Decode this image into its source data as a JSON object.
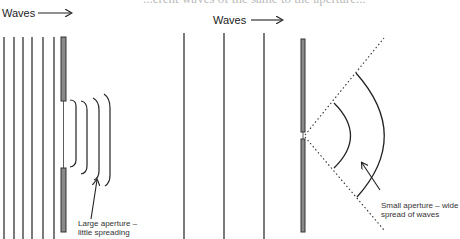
{
  "page": {
    "clipped_header": "...erent waves of the same to the aperture..."
  },
  "left_panel": {
    "waves_label": "Waves",
    "arrow_icon": "right-arrow",
    "caption": "Large aperture –\nlittle spreading",
    "description": "Plane waves passing through a large aperture; transmitted wavefronts remain nearly straight with slight curved edges"
  },
  "right_panel": {
    "waves_label": "Waves",
    "arrow_icon": "right-arrow",
    "caption": "Small aperture – wide\nspread of waves",
    "description": "Plane waves passing through a small aperture; transmitted wavefronts become circular arcs spreading widely within a dotted cone"
  },
  "colors": {
    "line": "#222222",
    "barrier_fill": "#8a8a8a",
    "barrier_stroke": "#333333"
  }
}
